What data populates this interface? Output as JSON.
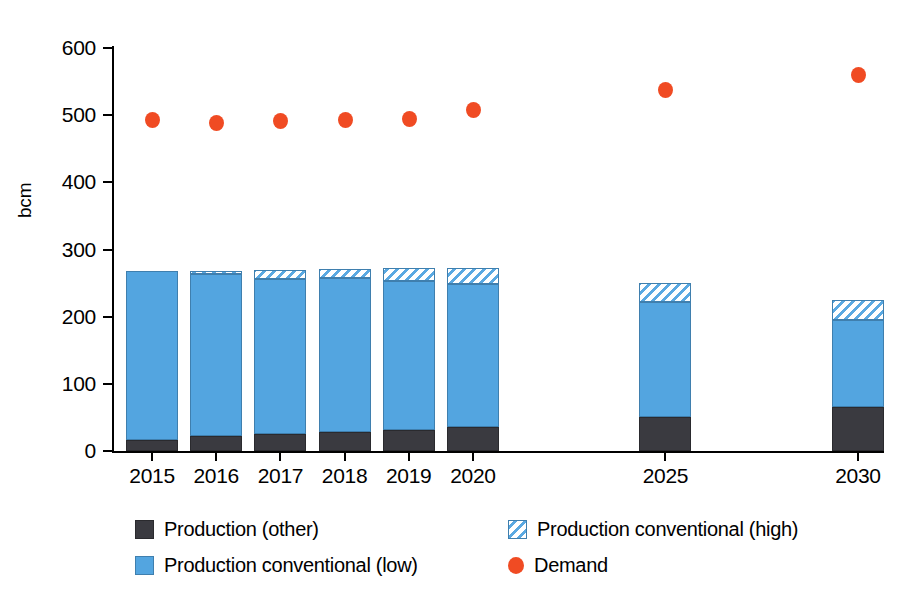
{
  "chart_data": {
    "type": "bar",
    "title": "",
    "subtitle": "",
    "xlabel": "",
    "ylabel": "bcm",
    "ylim": [
      0,
      600
    ],
    "ytick_values": [
      0,
      100,
      200,
      300,
      400,
      500,
      600
    ],
    "ytick_labels": [
      "0",
      "100",
      "200",
      "300",
      "400",
      "500",
      "600"
    ],
    "grid": false,
    "legend_position": "bottom",
    "categories": [
      "2015",
      "2016",
      "2017",
      "2018",
      "2019",
      "2020",
      "2025",
      "2030"
    ],
    "stacked": true,
    "series": [
      {
        "name": "Production (other)",
        "type": "bar",
        "color": "#3a3a40",
        "values": [
          17,
          22,
          25,
          29,
          31,
          35,
          50,
          65
        ]
      },
      {
        "name": "Production conventional (low)",
        "type": "bar",
        "color": "#53a5e0",
        "values": [
          251,
          241,
          231,
          229,
          222,
          213,
          172,
          130
        ]
      },
      {
        "name": "Production conventional (high)",
        "type": "bar",
        "color": "#ffffff",
        "hatch": "diagonal",
        "values": [
          0,
          5,
          13,
          13,
          20,
          25,
          28,
          30
        ]
      },
      {
        "name": "Demand",
        "type": "scatter",
        "color": "#f04b23",
        "values": [
          493,
          489,
          491,
          493,
          495,
          508,
          537,
          560
        ]
      }
    ],
    "stack_tops": {
      "other": [
        17,
        22,
        25,
        29,
        31,
        35,
        50,
        65
      ],
      "low": [
        268,
        263,
        256,
        258,
        253,
        248,
        222,
        195
      ],
      "high": [
        268,
        268,
        269,
        271,
        273,
        273,
        250,
        225
      ]
    },
    "legend": [
      {
        "label": "Production (other)",
        "swatch": "solid-dark",
        "color": "#3a3a40"
      },
      {
        "label": "Production conventional (high)",
        "swatch": "hatched-blue",
        "color": "#5aa9e2"
      },
      {
        "label": "Production conventional (low)",
        "swatch": "solid-blue",
        "color": "#53a5e0"
      },
      {
        "label": "Demand",
        "swatch": "orange-dot",
        "color": "#f04b23"
      }
    ]
  }
}
